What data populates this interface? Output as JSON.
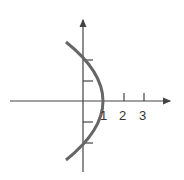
{
  "diagram": {
    "type": "parabola-graph",
    "x_axis": {
      "tick_labels": [
        "1",
        "2",
        "3"
      ]
    },
    "y_axis": {
      "tick_count_above": 2,
      "tick_count_below": 2
    },
    "curve": {
      "description": "leftward-opening parabola with vertex at x=1"
    },
    "colors": {
      "axis": "#444444",
      "curve": "#666666",
      "text": "#333333"
    }
  }
}
